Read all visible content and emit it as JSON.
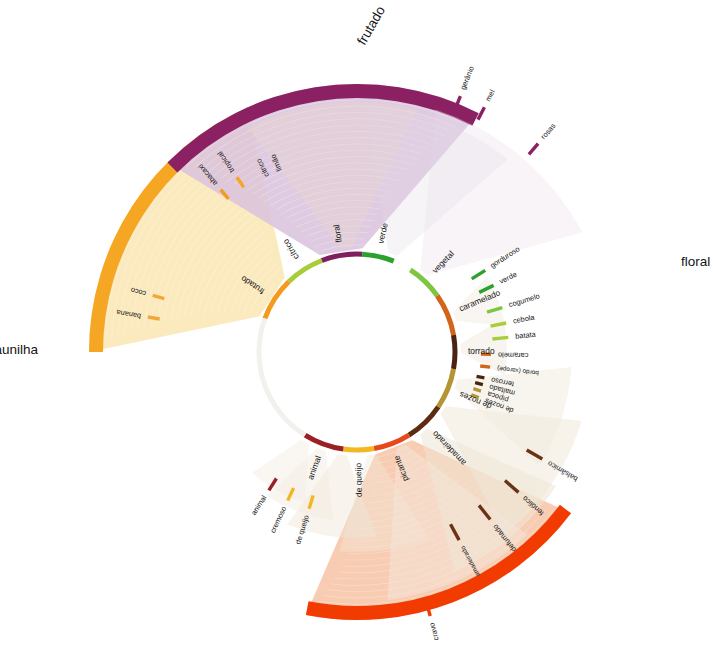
{
  "chart_data": {
    "type": "pie",
    "title": "",
    "subtitle": "",
    "xlabel": "",
    "ylabel": "",
    "legend_position": "none",
    "grid": false,
    "center": {
      "cx": 357,
      "cy": 352
    },
    "radii": {
      "inner_ring_r": 98,
      "inner_ring_width": 5,
      "leaf_tick_r": 118,
      "petal_inner_r": 104,
      "petal_outer_r": 268,
      "petal_band_width": 14
    },
    "inner_ring": [
      {
        "label": "frutado",
        "start_deg": -70,
        "end_deg": -44,
        "color": "#F59A1E",
        "value": 26
      },
      {
        "label": "cítrico",
        "start_deg": -44,
        "end_deg": -21,
        "color": "#A9CC3A",
        "value": 23
      },
      {
        "label": "floral",
        "start_deg": -21,
        "end_deg": 3,
        "color": "#7E1F5E",
        "value": 24
      },
      {
        "label": "verde",
        "start_deg": 3,
        "end_deg": 22,
        "color": "#2DA12D",
        "value": 19
      },
      {
        "label": "vegetal",
        "start_deg": 33,
        "end_deg": 55,
        "color": "#7DC63F",
        "value": 22
      },
      {
        "label": "caramelado",
        "start_deg": 55,
        "end_deg": 80,
        "color": "#D2651A",
        "value": 25
      },
      {
        "label": "torrado",
        "start_deg": 80,
        "end_deg": 100,
        "color": "#4A2410",
        "value": 20
      },
      {
        "label": "de nozes",
        "start_deg": 100,
        "end_deg": 124,
        "color": "#B59434",
        "value": 24
      },
      {
        "label": "amadeirado",
        "start_deg": 124,
        "end_deg": 148,
        "color": "#5E2B12",
        "value": 24
      },
      {
        "label": "picante",
        "start_deg": 148,
        "end_deg": 170,
        "color": "#E8491B",
        "value": 22
      },
      {
        "label": "de queijo",
        "start_deg": 170,
        "end_deg": 188,
        "color": "#F2B824",
        "value": 18
      },
      {
        "label": "animal",
        "start_deg": 188,
        "end_deg": 212,
        "color": "#9B2026",
        "value": 24
      },
      {
        "label": "",
        "start_deg": 212,
        "end_deg": 290,
        "color": "#F3F1EE",
        "value": 78
      }
    ],
    "petals": [
      {
        "label": "frutado",
        "start_deg": -70,
        "end_deg": -44,
        "spread_deg": 33,
        "band_color": "#F5A623",
        "fan_color": "#FBE6B4",
        "label_pos": {
          "x": 372,
          "y": 26,
          "rotate": -60
        }
      },
      {
        "label": "floral",
        "start_deg": -21,
        "end_deg": 3,
        "spread_deg": 36,
        "band_color": "#8B2063",
        "fan_color": "#D9C2DC",
        "label_pos": {
          "x": 681,
          "y": 262,
          "rotate": 0
        }
      },
      {
        "label": "baunilha",
        "start_deg": 148,
        "end_deg": 170,
        "spread_deg": 32,
        "band_color": "#F23B00",
        "fan_color": "#F7C3A5",
        "label_pos": {
          "x": 38,
          "y": 350,
          "rotate": 0
        }
      }
    ],
    "leaf_descriptors": [
      {
        "label": "banana",
        "angle_deg": -80.5,
        "color": "#F2A73B"
      },
      {
        "label": "coco",
        "angle_deg": -74.5,
        "color": "#F2A73B"
      },
      {
        "label": "abacaxi",
        "angle_deg": -40.0,
        "color": "#F59A1E"
      },
      {
        "label": "tropical",
        "angle_deg": -34.5,
        "color": "#F5A623"
      },
      {
        "label": "cítrico",
        "angle_deg": -27.0,
        "color": "#FFFFFF"
      },
      {
        "label": "limão",
        "angle_deg": -23.0,
        "color": "#FFFFFF"
      },
      {
        "label": "gerânio",
        "angle_deg": 22.0,
        "color": "#8B2063"
      },
      {
        "label": "mel",
        "angle_deg": 27.5,
        "color": "#8B2063"
      },
      {
        "label": "rosas",
        "angle_deg": 41.0,
        "color": "#8B2063"
      },
      {
        "label": "gorduroso",
        "angle_deg": 57.5,
        "color": "#2DA12D"
      },
      {
        "label": "verde",
        "angle_deg": 64.0,
        "color": "#2DA12D"
      },
      {
        "label": "cogumelo",
        "angle_deg": 73.0,
        "color": "#7DC63F"
      },
      {
        "label": "cebola",
        "angle_deg": 79.0,
        "color": "#A9CC3A"
      },
      {
        "label": "batata",
        "angle_deg": 84.5,
        "color": "#A9CC3A"
      },
      {
        "label": "caramelo",
        "angle_deg": 91.0,
        "color": "#D2651A"
      },
      {
        "label": "bordo (xarope)",
        "angle_deg": 96.5,
        "color": "#D2651A"
      },
      {
        "label": "terroso",
        "angle_deg": 101.5,
        "color": "#4A2410"
      },
      {
        "label": "maltado",
        "angle_deg": 104.5,
        "color": "#4A2410"
      },
      {
        "label": "pipoca",
        "angle_deg": 107.5,
        "color": "#B59434"
      },
      {
        "label": "de nozes",
        "angle_deg": 110.5,
        "color": "#B59434"
      },
      {
        "label": "balsâmico",
        "angle_deg": 120.0,
        "color": "#6B3316"
      },
      {
        "label": "fenólico",
        "angle_deg": 131.0,
        "color": "#6B3316"
      },
      {
        "label": "defumado",
        "angle_deg": 141.5,
        "color": "#6B3316"
      },
      {
        "label": "amadeirado",
        "angle_deg": 151.5,
        "color": "#6B3316"
      },
      {
        "label": "cravo",
        "angle_deg": 164.5,
        "color": "#F23B00"
      },
      {
        "label": "de queijo",
        "angle_deg": 197.0,
        "color": "#F2B824"
      },
      {
        "label": "cremoso",
        "angle_deg": 205.0,
        "color": "#F2B824"
      },
      {
        "label": "animal",
        "angle_deg": 212.5,
        "color": "#9B2026"
      }
    ],
    "legend_entries": []
  }
}
